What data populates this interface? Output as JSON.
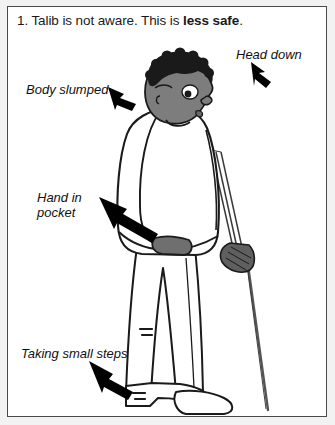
{
  "panel": {
    "number": "1.",
    "title_plain": "1. Talib is not aware. This is ",
    "title_emphasis": "less safe",
    "title_tail": ".",
    "title_full": "1. Talib is not aware. This is less safe.",
    "border_color": "#4a4a4a",
    "background_color": "#ffffff",
    "page_background_color": "#f2f2f2"
  },
  "callouts": [
    {
      "id": "head-down",
      "label": "Head down",
      "arrow_direction": "down-left",
      "points_to": "head"
    },
    {
      "id": "body-slumped",
      "label": "Body slumped",
      "arrow_direction": "down-right",
      "points_to": "shoulder"
    },
    {
      "id": "hand-in-pocket",
      "label": "Hand in\npocket",
      "arrow_direction": "down-right",
      "points_to": "hand-in-pocket"
    },
    {
      "id": "taking-small-steps",
      "label": "Taking small steps",
      "arrow_direction": "down-right",
      "points_to": "feet"
    }
  ],
  "figure": {
    "name": "talib",
    "skin_color": "#7d7d7d",
    "hair_color": "#1a1a1a",
    "clothing_color": "#ffffff",
    "outline_color": "#1a1a1a",
    "hand_glove_color": "#6b6b6b",
    "cane_color": "#555555",
    "parts": [
      "head",
      "hair",
      "eye",
      "nose",
      "mouth",
      "torso",
      "arm",
      "hand-in-pocket",
      "hand-gripping-cane",
      "legs",
      "shoes",
      "cane",
      "motion-marks"
    ]
  }
}
